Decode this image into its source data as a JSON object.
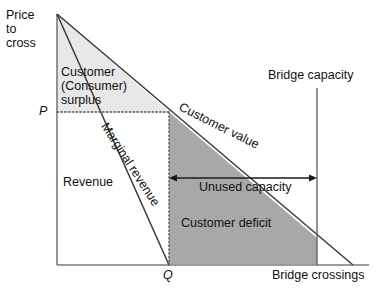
{
  "figure": {
    "type": "economics-diagram",
    "title_implied": "Bridge pricing: customer surplus, revenue and customer deficit",
    "axes": {
      "y_label": "Price\nto\ncross",
      "y_label_lines": [
        "Price",
        "to",
        "cross"
      ],
      "x_label": "Bridge crossings",
      "y_tick_label": "P",
      "x_tick_label": "Q"
    },
    "lines": [
      {
        "name": "customer-value-line",
        "label": "Customer value",
        "style": "solid",
        "from": {
          "x": 57,
          "y": 14
        },
        "to": {
          "x": 353,
          "y": 265
        }
      },
      {
        "name": "marginal-revenue-line",
        "label": "Marginal revenue",
        "style": "solid",
        "from": {
          "x": 57,
          "y": 14
        },
        "to": {
          "x": 169,
          "y": 265
        }
      },
      {
        "name": "bridge-capacity-line",
        "label": "Bridge capacity",
        "style": "solid-vertical",
        "x": 317
      }
    ],
    "guides": [
      {
        "name": "price-guide",
        "style": "dotted-horizontal",
        "y": 112,
        "from_x": 57,
        "to_x": 169
      },
      {
        "name": "quantity-guide",
        "style": "dotted-vertical",
        "x": 169,
        "from_y": 112,
        "to_y": 265
      }
    ],
    "regions": [
      {
        "name": "customer-surplus",
        "label": "Customer\n(Consumer)\nsurplus",
        "label_lines": [
          "Customer",
          "(Consumer)",
          "surplus"
        ],
        "fill": "#e8e8e8"
      },
      {
        "name": "revenue",
        "label": "Revenue",
        "fill": "#ffffff"
      },
      {
        "name": "customer-deficit",
        "label": "Customer deficit",
        "fill": "#a8a8a8"
      }
    ],
    "annotations": [
      {
        "name": "unused-capacity",
        "label": "Unused capacity",
        "arrow": "double-headed",
        "from_x": 169,
        "to_x": 317,
        "y": 178
      }
    ],
    "colors": {
      "line": "#3a3a3a",
      "axis": "#7a7a7a",
      "light_fill": "#e8e8e8",
      "dark_fill": "#a8a8a8",
      "text": "#111111",
      "background": "#ffffff"
    }
  }
}
